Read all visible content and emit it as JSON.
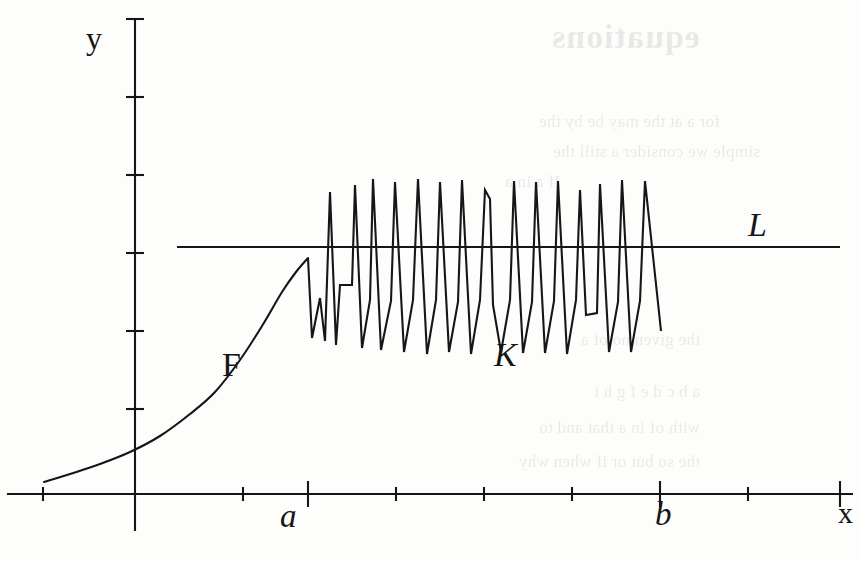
{
  "figure": {
    "kind": "mathematical-graph",
    "background_color": "#fdfdfc",
    "ink_color": "#161616"
  },
  "labels": {
    "y_axis": "y",
    "x_axis": "x",
    "point_a": "a",
    "point_b": "b",
    "curve_F": "F",
    "curve_K": "K",
    "line_L": "L"
  },
  "ghost_text": {
    "title": "equations",
    "lines": [
      "for a  at the  may be  by the",
      "simple  we consider  a still  the",
      "If  a  in  a",
      "the  given  no  of  a",
      "a  b  c  d  e  f  g  h  i",
      "with  of  in  a  that  and  to",
      "the  so  but  or  if  when  why"
    ]
  },
  "chart_data": {
    "type": "line",
    "title": "",
    "xlabel": "x",
    "ylabel": "y",
    "grid": false,
    "legend": "inline-annotations",
    "axes": {
      "x_axis_pixel_y": 494,
      "y_axis_pixel_x": 135,
      "x_ticks_pixels": [
        43,
        135,
        243,
        308,
        396,
        484,
        572,
        660,
        748,
        840
      ],
      "y_ticks_pixels": [
        19,
        97,
        175,
        253,
        331,
        409,
        494
      ],
      "major_x_ticks_pixels": [
        308,
        660,
        840
      ],
      "x_range_pixels": [
        8,
        852
      ],
      "y_axis_extent_pixels": [
        19,
        530
      ]
    },
    "series": [
      {
        "name": "F",
        "description": "smooth increasing convex curve from the left edge rising to the point a",
        "path_points": [
          [
            44,
            482
          ],
          [
            70,
            474
          ],
          [
            100,
            464
          ],
          [
            130,
            452
          ],
          [
            160,
            436
          ],
          [
            190,
            414
          ],
          [
            215,
            392
          ],
          [
            240,
            360
          ],
          [
            262,
            326
          ],
          [
            282,
            292
          ],
          [
            296,
            272
          ],
          [
            308,
            258
          ]
        ]
      },
      {
        "name": "K",
        "description": "rapidly oscillating zigzag between a and b crossing the horizontal line L",
        "path_points": [
          [
            308,
            258
          ],
          [
            312,
            338
          ],
          [
            320,
            298
          ],
          [
            325,
            341
          ],
          [
            330,
            192
          ],
          [
            336,
            345
          ],
          [
            340,
            285
          ],
          [
            352,
            285
          ],
          [
            355,
            185
          ],
          [
            362,
            348
          ],
          [
            370,
            300
          ],
          [
            373,
            179
          ],
          [
            381,
            350
          ],
          [
            391,
            301
          ],
          [
            395,
            182
          ],
          [
            404,
            352
          ],
          [
            413,
            300
          ],
          [
            418,
            179
          ],
          [
            427,
            354
          ],
          [
            436,
            300
          ],
          [
            440,
            182
          ],
          [
            449,
            352
          ],
          [
            458,
            302
          ],
          [
            462,
            180
          ],
          [
            471,
            354
          ],
          [
            480,
            300
          ],
          [
            485,
            190
          ],
          [
            490,
            199
          ],
          [
            493,
            305
          ],
          [
            501,
            352
          ],
          [
            510,
            300
          ],
          [
            514,
            181
          ],
          [
            523,
            353
          ],
          [
            532,
            302
          ],
          [
            536,
            182
          ],
          [
            545,
            353
          ],
          [
            554,
            301
          ],
          [
            558,
            181
          ],
          [
            567,
            354
          ],
          [
            576,
            300
          ],
          [
            580,
            190
          ],
          [
            586,
            315
          ],
          [
            597,
            313
          ],
          [
            600,
            184
          ],
          [
            609,
            352
          ],
          [
            618,
            302
          ],
          [
            622,
            180
          ],
          [
            631,
            352
          ],
          [
            640,
            301
          ],
          [
            645,
            181
          ],
          [
            661,
            331
          ]
        ]
      },
      {
        "name": "L",
        "description": "horizontal asymptote line that the oscillation straddles",
        "path_points": [
          [
            177,
            247
          ],
          [
            840,
            247
          ]
        ]
      }
    ],
    "annotations": [
      {
        "text": "y",
        "pixel": [
          97,
          40
        ],
        "style": "upright"
      },
      {
        "text": "x",
        "pixel": [
          845,
          512
        ],
        "style": "upright"
      },
      {
        "text": "a",
        "pixel": [
          292,
          516
        ],
        "style": "italic"
      },
      {
        "text": "b",
        "pixel": [
          665,
          514
        ],
        "style": "italic"
      },
      {
        "text": "F",
        "pixel": [
          234,
          365
        ],
        "style": "upright"
      },
      {
        "text": "K",
        "pixel": [
          506,
          355
        ],
        "style": "italic"
      },
      {
        "text": "L",
        "pixel": [
          760,
          225
        ],
        "style": "italic"
      }
    ]
  }
}
